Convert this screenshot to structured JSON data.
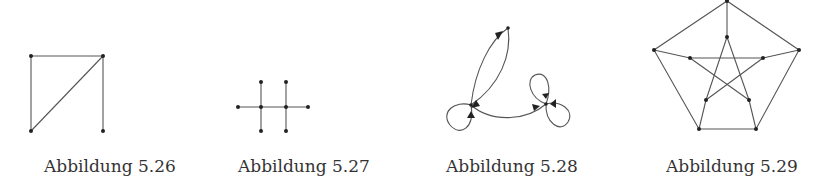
{
  "figures": [
    {
      "id": "fig-5-26",
      "caption": "Abbildung 5.26",
      "type": "undirected-graph",
      "vertices": [
        [
          31,
          56
        ],
        [
          103,
          56
        ],
        [
          31,
          131
        ],
        [
          103,
          131
        ]
      ],
      "edges": [
        [
          0,
          1
        ],
        [
          0,
          2
        ],
        [
          1,
          2
        ],
        [
          1,
          3
        ]
      ]
    },
    {
      "id": "fig-5-27",
      "caption": "Abbildung 5.27",
      "type": "tree",
      "vertices": [
        [
          261,
          107
        ],
        [
          286,
          107
        ],
        [
          261,
          82
        ],
        [
          286,
          82
        ],
        [
          261,
          131
        ],
        [
          286,
          131
        ],
        [
          238,
          107
        ],
        [
          308,
          107
        ]
      ],
      "edges": [
        [
          0,
          1
        ],
        [
          0,
          2
        ],
        [
          0,
          4
        ],
        [
          0,
          6
        ],
        [
          1,
          3
        ],
        [
          1,
          5
        ],
        [
          1,
          7
        ]
      ]
    },
    {
      "id": "fig-5-28",
      "caption": "Abbildung 5.28",
      "type": "directed-multigraph-with-loops",
      "vertices": [
        [
          508,
          28
        ],
        [
          471,
          105
        ],
        [
          546,
          104
        ]
      ]
    },
    {
      "id": "fig-5-29",
      "caption": "Abbildung 5.29",
      "type": "petersen-graph",
      "outer": [
        [
          727,
          1
        ],
        [
          654,
          50
        ],
        [
          699,
          129
        ],
        [
          756,
          129
        ],
        [
          799,
          50
        ]
      ],
      "inner": [
        [
          727,
          37
        ],
        [
          690,
          58
        ],
        [
          706,
          100
        ],
        [
          749,
          100
        ],
        [
          763,
          58
        ]
      ]
    }
  ],
  "colors": {
    "edge": "#555555",
    "vertex": "#222222",
    "caption": "#333333"
  }
}
